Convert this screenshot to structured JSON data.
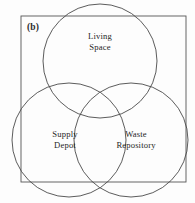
{
  "figure": {
    "panel_label": "(b)",
    "background_color": "#fdfdfd",
    "stroke_color": "#4a4a4a",
    "text_color": "#262626",
    "width": 195,
    "height": 203
  },
  "diagram": {
    "type": "venn-three-set",
    "bounding_box_label": "universe-rectangle",
    "sets": [
      {
        "id": "living-space",
        "label_line_1": "Living",
        "label_line_2": "Space",
        "full_label": "Living Space",
        "center_x": 100,
        "center_y": 61,
        "radius": 57
      },
      {
        "id": "supply-depot",
        "label_line_1": "Supply",
        "label_line_2": "Depot",
        "full_label": "Supply Depot",
        "center_x": 69,
        "center_y": 140,
        "radius": 57
      },
      {
        "id": "waste-repository",
        "label_line_1": "Waste",
        "label_line_2": "Repository",
        "full_label": "Waste Repository",
        "center_x": 131,
        "center_y": 140,
        "radius": 57
      }
    ],
    "rectangle": {
      "x": 21,
      "y": 16,
      "width": 165,
      "height": 166
    }
  }
}
